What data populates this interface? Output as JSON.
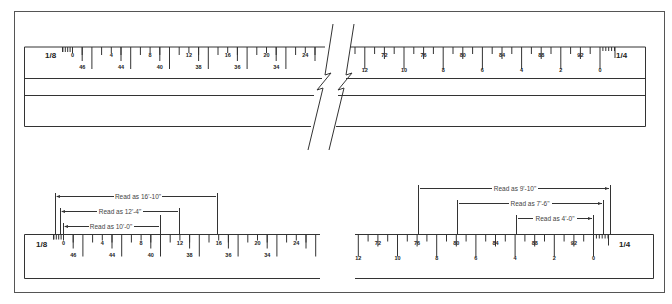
{
  "figure": {
    "colors": {
      "line": "#333333",
      "frame": "#555555",
      "background": "#ffffff"
    }
  },
  "top_scale": {
    "left_ratio": "1/8",
    "right_ratio": "1/4",
    "left_top_labels": [
      "0",
      "4",
      "8",
      "12",
      "16",
      "20",
      "24"
    ],
    "left_bottom_labels": [
      "46",
      "44",
      "40",
      "38",
      "36",
      "34"
    ],
    "right_top_labels": [
      "72",
      "76",
      "80",
      "84",
      "88",
      "92"
    ],
    "right_bottom_labels": [
      "12",
      "10",
      "8",
      "6",
      "4",
      "2",
      "0"
    ]
  },
  "bottom_left_scale": {
    "ratio": "1/8",
    "top_labels": [
      "0",
      "4",
      "8",
      "12",
      "16",
      "20",
      "24"
    ],
    "bottom_labels": [
      "46",
      "44",
      "40",
      "38",
      "36",
      "34"
    ],
    "readings": [
      {
        "label": "Read as 16'-10\""
      },
      {
        "label": "Read as 12'-4\""
      },
      {
        "label": "Read as 10'-0\""
      }
    ]
  },
  "bottom_right_scale": {
    "ratio": "1/4",
    "top_labels": [
      "72",
      "76",
      "80",
      "84",
      "88",
      "92"
    ],
    "bottom_labels": [
      "12",
      "10",
      "8",
      "6",
      "4",
      "2",
      "0"
    ],
    "readings": [
      {
        "label": "Read as 9'-10\""
      },
      {
        "label": "Read as 7'-6\""
      },
      {
        "label": "Read as 4'-0\""
      }
    ]
  }
}
